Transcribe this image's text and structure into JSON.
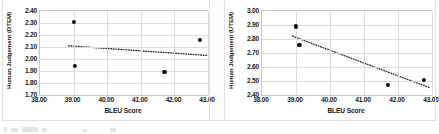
{
  "figure": {
    "background_color": "#ffffff",
    "grid_color": "#dcdcdc",
    "marker_color": "#0d0d0d",
    "trendline_color": "#2b2b2b",
    "axis_border_color": "#c8c8c8"
  },
  "chart_data": [
    {
      "type": "scatter",
      "panel": "left",
      "title": "",
      "xlabel": "BLEU Score",
      "ylabel": "Human Judgement (DTEM)",
      "xlim": [
        38.0,
        43.0
      ],
      "ylim": [
        1.7,
        2.4
      ],
      "xticks": [
        "38.00",
        "39.00",
        "40.00",
        "41.00",
        "42.00",
        "43.00"
      ],
      "xtick_values": [
        38.0,
        39.0,
        40.0,
        41.0,
        42.0,
        43.0
      ],
      "yticks": [
        "1.70",
        "1.80",
        "1.90",
        "2.00",
        "2.10",
        "2.20",
        "2.30",
        "2.40"
      ],
      "ytick_values": [
        1.7,
        1.8,
        1.9,
        2.0,
        2.1,
        2.2,
        2.3,
        2.4
      ],
      "grid": true,
      "legend": "none",
      "points": [
        {
          "x": 39.0,
          "y": 2.31
        },
        {
          "x": 39.05,
          "y": 1.94
        },
        {
          "x": 41.7,
          "y": 1.89
        },
        {
          "x": 42.75,
          "y": 2.16
        }
      ],
      "trendline": {
        "style": "dotted",
        "x_start": 38.85,
        "y_start": 2.11,
        "x_end": 42.95,
        "y_end": 2.03
      }
    },
    {
      "type": "scatter",
      "panel": "right",
      "title": "",
      "xlabel": "BLEU Score",
      "ylabel": "Human Judgement (UTEM)",
      "xlim": [
        38.0,
        43.0
      ],
      "ylim": [
        2.4,
        3.0
      ],
      "xticks": [
        "38.00",
        "39.00",
        "40.00",
        "41.00",
        "42.00",
        "43.00"
      ],
      "xtick_values": [
        38.0,
        39.0,
        40.0,
        41.0,
        42.0,
        43.0
      ],
      "yticks": [
        "2.40",
        "2.50",
        "2.60",
        "2.70",
        "2.80",
        "2.90",
        "3.00"
      ],
      "ytick_values": [
        2.4,
        2.5,
        2.6,
        2.7,
        2.8,
        2.9,
        3.0
      ],
      "grid": true,
      "legend": "none",
      "points": [
        {
          "x": 39.0,
          "y": 2.89
        },
        {
          "x": 39.1,
          "y": 2.76
        },
        {
          "x": 41.7,
          "y": 2.47
        },
        {
          "x": 42.75,
          "y": 2.51
        }
      ],
      "trendline": {
        "style": "dotted",
        "x_start": 38.9,
        "y_start": 2.82,
        "x_end": 42.95,
        "y_end": 2.45
      }
    }
  ]
}
